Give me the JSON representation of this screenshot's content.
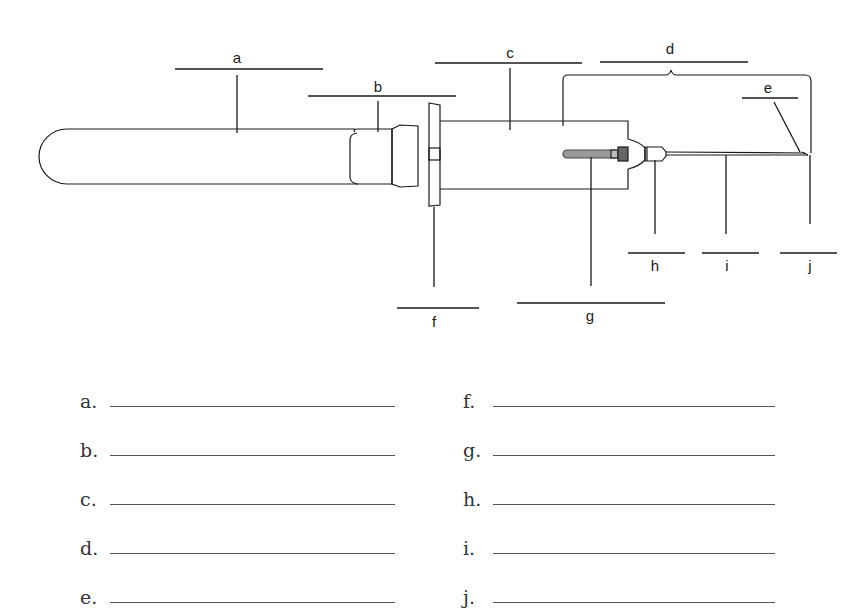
{
  "diagram": {
    "callouts": [
      {
        "id": "a",
        "label": "a"
      },
      {
        "id": "b",
        "label": "b"
      },
      {
        "id": "c",
        "label": "c"
      },
      {
        "id": "d",
        "label": "d"
      },
      {
        "id": "e",
        "label": "e"
      },
      {
        "id": "f",
        "label": "f"
      },
      {
        "id": "g",
        "label": "g"
      },
      {
        "id": "h",
        "label": "h"
      },
      {
        "id": "i",
        "label": "i"
      },
      {
        "id": "j",
        "label": "j"
      }
    ]
  },
  "answers": {
    "left": [
      {
        "label": "a.",
        "value": ""
      },
      {
        "label": "b.",
        "value": ""
      },
      {
        "label": "c.",
        "value": ""
      },
      {
        "label": "d.",
        "value": ""
      },
      {
        "label": "e.",
        "value": ""
      }
    ],
    "right": [
      {
        "label": "f.",
        "value": ""
      },
      {
        "label": "g.",
        "value": ""
      },
      {
        "label": "h.",
        "value": ""
      },
      {
        "label": "i.",
        "value": ""
      },
      {
        "label": "j.",
        "value": ""
      }
    ]
  }
}
